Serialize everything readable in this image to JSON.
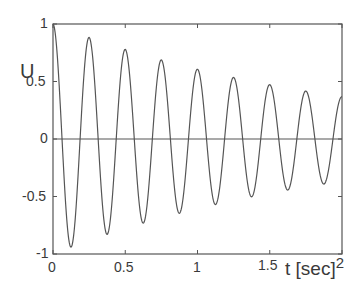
{
  "chart_data": {
    "type": "line",
    "title": "",
    "xlabel": "t [sec]",
    "ylabel": "U",
    "xlim": [
      0,
      2
    ],
    "ylim": [
      -1,
      1
    ],
    "xticks": [
      "0",
      "0.5",
      "1",
      "1.5",
      "2"
    ],
    "yticks": [
      "1",
      "0.5",
      "0",
      "-0.5",
      "-1"
    ],
    "grid": false,
    "legend": null,
    "series": [
      {
        "name": "U(t)",
        "description": "Damped cosine oscillation, U ≈ exp(-0.5 t)·cos(8πt), period ≈ 0.25 s",
        "peaks": [
          {
            "t": 0.0,
            "U": 1.0
          },
          {
            "t": 0.25,
            "U": 0.88
          },
          {
            "t": 0.5,
            "U": 0.78
          },
          {
            "t": 0.75,
            "U": 0.69
          },
          {
            "t": 1.0,
            "U": 0.61
          },
          {
            "t": 1.25,
            "U": 0.54
          },
          {
            "t": 1.5,
            "U": 0.47
          },
          {
            "t": 1.75,
            "U": 0.42
          }
        ],
        "troughs": [
          {
            "t": 0.125,
            "U": -0.94
          },
          {
            "t": 0.375,
            "U": -0.83
          },
          {
            "t": 0.625,
            "U": -0.73
          },
          {
            "t": 0.875,
            "U": -0.65
          },
          {
            "t": 1.125,
            "U": -0.57
          },
          {
            "t": 1.375,
            "U": -0.5
          },
          {
            "t": 1.625,
            "U": -0.44
          },
          {
            "t": 1.875,
            "U": -0.39
          }
        ],
        "decay_rate": 0.5,
        "frequency_hz": 4
      }
    ],
    "zero_line": true
  },
  "labels": {
    "ylabel": "U",
    "xlabel_main": "t [sec]",
    "xlabel_sup": "2",
    "yticks": [
      "1",
      "0.5",
      "0",
      "-0.5",
      "-1"
    ],
    "xticks": [
      "0",
      "0.5",
      "1",
      "1.5"
    ]
  },
  "colors": {
    "line": "#555555",
    "axes": "#555555"
  }
}
